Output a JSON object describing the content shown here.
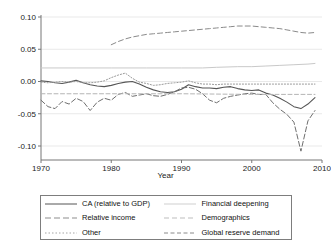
{
  "chart_data": {
    "type": "line",
    "title": "",
    "xlabel": "Year",
    "ylabel": "",
    "xlim": [
      1970,
      2010
    ],
    "ylim": [
      -0.1,
      0.1
    ],
    "xticks": [
      1970,
      1980,
      1990,
      2000,
      2010
    ],
    "xtick_labels": [
      "1970",
      "1980",
      "1990",
      "2000",
      "2010"
    ],
    "yticks": [
      0.1,
      0.05,
      0.0,
      -0.05,
      -0.1
    ],
    "ytick_labels": [
      "0.10",
      "0.05",
      "0.00",
      "-0.05",
      "-0.10"
    ],
    "grid": true,
    "legend_position": "bottom",
    "series": [
      {
        "name": "CA (relative to GDP)",
        "style": "solid",
        "color": "#555555",
        "x": [
          1970,
          1971,
          1972,
          1973,
          1974,
          1975,
          1976,
          1977,
          1978,
          1979,
          1980,
          1981,
          1982,
          1983,
          1984,
          1985,
          1986,
          1987,
          1988,
          1989,
          1990,
          1991,
          1992,
          1993,
          1994,
          1995,
          1996,
          1997,
          1998,
          1999,
          2000,
          2001,
          2002,
          2003,
          2004,
          2005,
          2006,
          2007,
          2008,
          2009
        ],
        "values": [
          0.001,
          0.0,
          -0.002,
          -0.003,
          -0.001,
          0.002,
          -0.002,
          -0.005,
          -0.007,
          -0.008,
          -0.006,
          -0.003,
          -0.001,
          0.0,
          -0.004,
          -0.009,
          -0.013,
          -0.016,
          -0.017,
          -0.016,
          -0.012,
          -0.005,
          -0.008,
          -0.01,
          -0.01,
          -0.011,
          -0.009,
          -0.008,
          -0.011,
          -0.013,
          -0.014,
          -0.013,
          -0.018,
          -0.021,
          -0.026,
          -0.032,
          -0.039,
          -0.042,
          -0.035,
          -0.025
        ]
      },
      {
        "name": "Relative income",
        "style": "dash",
        "color": "#6f6f6f",
        "x": [
          1970,
          1971,
          1972,
          1973,
          1974,
          1975,
          1976,
          1977,
          1978,
          1979,
          1980,
          1981,
          1982,
          1983,
          1984,
          1985,
          1986,
          1987,
          1988,
          1989,
          1990,
          1991,
          1992,
          1993,
          1994,
          1995,
          1996,
          1997,
          1998,
          1999,
          2000,
          2001,
          2002,
          2003,
          2004,
          2005,
          2006,
          2007,
          2008,
          2009
        ],
        "values": [
          -0.029,
          -0.039,
          -0.042,
          -0.031,
          -0.035,
          -0.026,
          -0.031,
          -0.045,
          -0.032,
          -0.026,
          -0.029,
          -0.02,
          -0.017,
          -0.023,
          -0.021,
          -0.019,
          -0.022,
          -0.023,
          -0.02,
          -0.016,
          -0.01,
          -0.009,
          -0.012,
          -0.019,
          -0.029,
          -0.033,
          -0.026,
          -0.023,
          -0.021,
          -0.019,
          -0.018,
          -0.02,
          -0.02,
          -0.033,
          -0.043,
          -0.051,
          -0.063,
          -0.108,
          -0.061,
          -0.045
        ]
      },
      {
        "name": "Other",
        "style": "dot",
        "color": "#9a9a9a",
        "x": [
          1970,
          1971,
          1972,
          1973,
          1974,
          1975,
          1976,
          1977,
          1978,
          1979,
          1980,
          1981,
          1982,
          1983,
          1984,
          1985,
          1986,
          1987,
          1988,
          1989,
          1990,
          1991,
          1992,
          1993,
          1994,
          1995,
          1996,
          1997,
          1998,
          1999,
          2000,
          2001,
          2002,
          2003,
          2004,
          2005,
          2006,
          2007,
          2008,
          2009
        ],
        "values": [
          -0.001,
          -0.002,
          -0.001,
          0.0,
          -0.001,
          0.0,
          -0.002,
          -0.002,
          -0.001,
          0.001,
          0.006,
          0.01,
          0.013,
          0.005,
          -0.001,
          -0.003,
          -0.006,
          -0.005,
          -0.003,
          -0.002,
          -0.001,
          0.001,
          -0.002,
          -0.004,
          -0.004,
          -0.005,
          -0.004,
          -0.004,
          -0.004,
          -0.004,
          -0.004,
          -0.004,
          -0.004,
          -0.004,
          -0.004,
          -0.004,
          -0.004,
          -0.004,
          -0.004,
          -0.004
        ]
      },
      {
        "name": "Financial deepening",
        "style": "solid-light",
        "color": "#c9c9c9",
        "x": [
          1970,
          1975,
          1980,
          1985,
          1990,
          1993,
          1995,
          1998,
          2000,
          2002,
          2004,
          2006,
          2008,
          2009
        ],
        "values": [
          0.021,
          0.021,
          0.021,
          0.021,
          0.021,
          0.021,
          0.022,
          0.023,
          0.023,
          0.024,
          0.025,
          0.026,
          0.027,
          0.028
        ]
      },
      {
        "name": "Demographics",
        "style": "dash-light",
        "color": "#b5b5b5",
        "x": [
          1970,
          1980,
          1990,
          2000,
          2009
        ],
        "values": [
          -0.019,
          -0.019,
          -0.019,
          -0.02,
          -0.02
        ]
      },
      {
        "name": "Global reserve demand",
        "style": "dash-long",
        "color": "#8a8a8a",
        "x": [
          1980,
          1981,
          1982,
          1983,
          1984,
          1985,
          1986,
          1987,
          1988,
          1989,
          1990,
          1991,
          1992,
          1993,
          1994,
          1995,
          1996,
          1997,
          1998,
          1999,
          2000,
          2001,
          2002,
          2003,
          2004,
          2005,
          2006,
          2007,
          2008,
          2009
        ],
        "values": [
          0.057,
          0.062,
          0.066,
          0.069,
          0.071,
          0.073,
          0.074,
          0.075,
          0.076,
          0.077,
          0.078,
          0.079,
          0.08,
          0.081,
          0.082,
          0.083,
          0.084,
          0.085,
          0.086,
          0.086,
          0.086,
          0.085,
          0.084,
          0.083,
          0.082,
          0.08,
          0.078,
          0.076,
          0.075,
          0.076
        ]
      }
    ]
  },
  "legend": {
    "col1": [
      {
        "label": "CA (relative to GDP)"
      },
      {
        "label": "Relative income"
      },
      {
        "label": "Other"
      }
    ],
    "col2": [
      {
        "label": "Financial deepening"
      },
      {
        "label": "Demographics"
      },
      {
        "label": "Global reserve demand"
      }
    ]
  },
  "axis": {
    "xtitle": "Year"
  }
}
